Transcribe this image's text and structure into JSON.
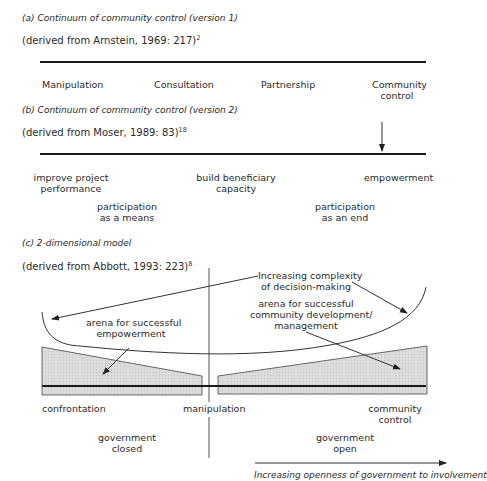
{
  "panel_a": {
    "title": "(a) Continuum of community control (version 1)",
    "source": "(derived from Arnstein, 1969: 217)",
    "source_ref": "2",
    "labels": [
      "Manipulation",
      "Consultation",
      "Partnership",
      "Community",
      "control"
    ]
  },
  "panel_b": {
    "title": "(b) Continuum of community control (version 2)",
    "source": "(derived from Moser, 1989: 83)",
    "source_ref": "18",
    "labels": {
      "improve_1": "improve project",
      "improve_2": "performance",
      "build_1": "build beneficiary",
      "build_2": "capacity",
      "empowerment": "empowerment",
      "means_1": "participation",
      "means_2": "as a means",
      "end_1": "participation",
      "end_2": "as an end"
    }
  },
  "panel_c": {
    "title": "(c) 2-dimensional model",
    "source": "(derived from Abbott, 1993: 223)",
    "source_ref": "8",
    "labels": {
      "complexity_1": "Increasing complexity",
      "complexity_2": "of decision-making",
      "arena_emp_1": "arena for successful",
      "arena_emp_2": "empowerment",
      "arena_comm_1": "arena for successful",
      "arena_comm_2": "community development/",
      "arena_comm_3": "management",
      "confrontation": "confrontation",
      "manipulation": "manipulation",
      "community_1": "community",
      "community_2": "control",
      "gov_closed_1": "government",
      "gov_closed_2": "closed",
      "gov_open_1": "government",
      "gov_open_2": "open",
      "openness_caption": "Increasing openness of government to involvement"
    }
  }
}
